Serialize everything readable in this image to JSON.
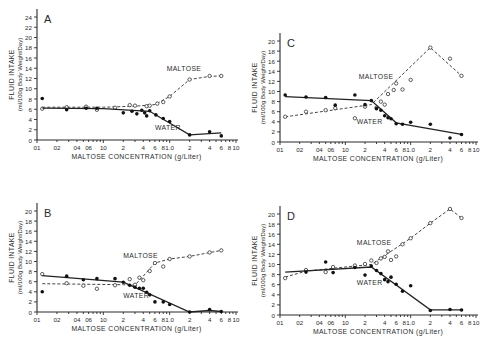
{
  "figure": {
    "xlabel": "MALTOSE CONCENTRATION (g/Liter)",
    "ylabel_line1": "FLUID INTAKE",
    "ylabel_line2": "(ml/100g Body Weight/Day)",
    "x_tick_labels": [
      {
        "v": 0.01,
        "t": "01"
      },
      {
        "v": 0.02,
        "t": "02"
      },
      {
        "v": 0.04,
        "t": "04"
      },
      {
        "v": 0.06,
        "t": "06"
      },
      {
        "v": 0.1,
        "t": "10"
      },
      {
        "v": 0.2,
        "t": "2"
      },
      {
        "v": 0.4,
        "t": "4"
      },
      {
        "v": 0.6,
        "t": "6"
      },
      {
        "v": 0.8,
        "t": "8"
      },
      {
        "v": 1,
        "t": "1.0"
      },
      {
        "v": 2,
        "t": "2"
      },
      {
        "v": 4,
        "t": "4"
      },
      {
        "v": 6,
        "t": "6"
      },
      {
        "v": 8,
        "t": "8"
      },
      {
        "v": 10,
        "t": "10"
      }
    ],
    "series_labels": {
      "maltose": "MALTOSE",
      "water": "WATER"
    }
  },
  "chart_data": [
    {
      "panel": "A",
      "type": "line",
      "title": "A",
      "xlabel": "MALTOSE CONCENTRATION (g/Liter)",
      "ylabel": "FLUID INTAKE (ml/100g Body Weight/Day)",
      "xscale": "log",
      "xlim": [
        0.01,
        10
      ],
      "ylim": [
        0,
        24
      ],
      "yticks": [
        0,
        2,
        4,
        6,
        8,
        10,
        12,
        14,
        16,
        18,
        20,
        22,
        24
      ],
      "grid": false,
      "frame": {
        "x0": 37,
        "x1": 236,
        "y0": 140,
        "ytop_val": 24,
        "ytop_px": 17
      },
      "label_pos": {
        "maltose": [
          0.9,
          13.5
        ],
        "water": [
          0.6,
          2.0
        ]
      },
      "series": [
        {
          "name": "MALTOSE",
          "style": "dashed-open-circle",
          "line": [
            [
              0.012,
              6.4
            ],
            [
              0.03,
              6.4
            ],
            [
              0.1,
              6.4
            ],
            [
              0.3,
              6.6
            ],
            [
              0.6,
              6.9
            ],
            [
              1,
              8.5
            ],
            [
              2,
              11.8
            ],
            [
              4,
              12.4
            ],
            [
              6,
              12.5
            ]
          ],
          "points": [
            [
              0.012,
              6.1
            ],
            [
              0.028,
              6.4
            ],
            [
              0.055,
              6.5
            ],
            [
              0.08,
              5.9
            ],
            [
              0.15,
              6.3
            ],
            [
              0.25,
              6.8
            ],
            [
              0.3,
              6.7
            ],
            [
              0.45,
              6.6
            ],
            [
              0.5,
              6.7
            ],
            [
              0.65,
              7.1
            ],
            [
              0.8,
              7.4
            ],
            [
              1,
              8.5
            ],
            [
              2,
              11.8
            ],
            [
              4,
              12.5
            ],
            [
              6,
              12.5
            ]
          ]
        },
        {
          "name": "WATER",
          "style": "solid-filled-circle",
          "line": [
            [
              0.012,
              6.2
            ],
            [
              0.1,
              6.1
            ],
            [
              0.5,
              5.6
            ],
            [
              2,
              1.0
            ],
            [
              6,
              1.4
            ]
          ],
          "points": [
            [
              0.012,
              8.1
            ],
            [
              0.028,
              5.9
            ],
            [
              0.055,
              6.2
            ],
            [
              0.08,
              6.2
            ],
            [
              0.2,
              5.3
            ],
            [
              0.27,
              5.6
            ],
            [
              0.32,
              5.1
            ],
            [
              0.38,
              5.8
            ],
            [
              0.42,
              5.3
            ],
            [
              0.45,
              4.7
            ],
            [
              0.5,
              5.7
            ],
            [
              0.62,
              4.9
            ],
            [
              0.8,
              4.2
            ],
            [
              1,
              3.6
            ],
            [
              2,
              1.0
            ],
            [
              4,
              1.6
            ],
            [
              6,
              0.8
            ]
          ]
        }
      ]
    },
    {
      "panel": "C",
      "type": "line",
      "title": "C",
      "xlabel": "MALTOSE CONCENTRATION (g/Liter)",
      "ylabel": "FLUID INTAKE (ml/100g Body Weight/Day)",
      "xscale": "log",
      "xlim": [
        0.01,
        10
      ],
      "ylim": [
        0,
        20
      ],
      "yticks": [
        0,
        2,
        4,
        6,
        8,
        10,
        12,
        14,
        16,
        18,
        20
      ],
      "grid": false,
      "frame": {
        "x0": 280,
        "x1": 476,
        "y0": 142,
        "ytop_val": 20,
        "ytop_px": 41
      },
      "label_pos": {
        "maltose": [
          0.16,
          12.5
        ],
        "water": [
          0.15,
          3.6
        ]
      },
      "series": [
        {
          "name": "MALTOSE",
          "style": "dashed-open-circle",
          "line": [
            [
              0.012,
              5.0
            ],
            [
              0.25,
              7.4
            ],
            [
              2,
              18.7
            ],
            [
              6,
              13.1
            ]
          ],
          "points": [
            [
              0.012,
              5.0
            ],
            [
              0.025,
              6.0
            ],
            [
              0.05,
              6.3
            ],
            [
              0.07,
              6.7
            ],
            [
              0.14,
              4.7
            ],
            [
              0.2,
              7.0
            ],
            [
              0.3,
              6.8
            ],
            [
              0.35,
              8.0
            ],
            [
              0.4,
              7.4
            ],
            [
              0.45,
              9.5
            ],
            [
              0.55,
              10.3
            ],
            [
              0.6,
              11.6
            ],
            [
              0.75,
              10.4
            ],
            [
              1,
              12.3
            ],
            [
              2,
              18.7
            ],
            [
              4,
              16.5
            ],
            [
              6,
              13.1
            ]
          ]
        },
        {
          "name": "WATER",
          "style": "solid-filled-circle",
          "line": [
            [
              0.012,
              9.0
            ],
            [
              0.25,
              8.2
            ],
            [
              0.6,
              3.8
            ],
            [
              6,
              1.5
            ]
          ],
          "points": [
            [
              0.012,
              9.3
            ],
            [
              0.025,
              8.9
            ],
            [
              0.05,
              8.8
            ],
            [
              0.07,
              7.3
            ],
            [
              0.14,
              9.3
            ],
            [
              0.2,
              7.4
            ],
            [
              0.25,
              8.2
            ],
            [
              0.3,
              6.6
            ],
            [
              0.35,
              6.3
            ],
            [
              0.4,
              5.2
            ],
            [
              0.45,
              4.8
            ],
            [
              0.5,
              4.6
            ],
            [
              0.6,
              3.6
            ],
            [
              0.75,
              3.5
            ],
            [
              1,
              3.9
            ],
            [
              2,
              3.5
            ],
            [
              4,
              0.8
            ],
            [
              6,
              1.5
            ]
          ]
        }
      ]
    },
    {
      "panel": "B",
      "type": "line",
      "title": "B",
      "xlabel": "MALTOSE CONCENTRATION (g/Liter)",
      "ylabel": "FLUID INTAKE (ml/100g Body Weight/Day)",
      "xscale": "log",
      "xlim": [
        0.01,
        10
      ],
      "ylim": [
        0,
        20
      ],
      "yticks": [
        0,
        2,
        4,
        6,
        8,
        10,
        12,
        14,
        16,
        18,
        20
      ],
      "grid": false,
      "frame": {
        "x0": 37,
        "x1": 236,
        "y0": 312,
        "ytop_val": 20,
        "ytop_px": 211
      },
      "label_pos": {
        "maltose": [
          0.2,
          10.7
        ],
        "water": [
          0.2,
          2.8
        ]
      },
      "series": [
        {
          "name": "MALTOSE",
          "style": "dashed-open-circle",
          "line": [
            [
              0.012,
              5.6
            ],
            [
              0.2,
              5.4
            ],
            [
              0.3,
              5.3
            ],
            [
              0.6,
              9.7
            ],
            [
              1,
              10.5
            ],
            [
              2,
              11.0
            ],
            [
              6,
              12.2
            ]
          ],
          "points": [
            [
              0.012,
              7.5
            ],
            [
              0.028,
              5.7
            ],
            [
              0.05,
              5.2
            ],
            [
              0.08,
              4.6
            ],
            [
              0.15,
              5.3
            ],
            [
              0.25,
              6.5
            ],
            [
              0.3,
              5.4
            ],
            [
              0.35,
              6.8
            ],
            [
              0.4,
              6.3
            ],
            [
              0.5,
              8.1
            ],
            [
              0.6,
              9.7
            ],
            [
              0.8,
              9.0
            ],
            [
              1,
              10.5
            ],
            [
              2,
              11.0
            ],
            [
              4,
              11.8
            ],
            [
              6,
              12.2
            ]
          ]
        },
        {
          "name": "WATER",
          "style": "solid-filled-circle",
          "line": [
            [
              0.012,
              7.2
            ],
            [
              0.2,
              5.9
            ],
            [
              2,
              0.0
            ],
            [
              4,
              0.3
            ],
            [
              6,
              0.1
            ]
          ],
          "points": [
            [
              0.012,
              4.0
            ],
            [
              0.028,
              7.1
            ],
            [
              0.05,
              6.4
            ],
            [
              0.08,
              6.6
            ],
            [
              0.15,
              6.6
            ],
            [
              0.2,
              5.9
            ],
            [
              0.25,
              5.3
            ],
            [
              0.3,
              4.9
            ],
            [
              0.35,
              4.7
            ],
            [
              0.4,
              4.7
            ],
            [
              0.45,
              3.9
            ],
            [
              0.5,
              3.4
            ],
            [
              0.6,
              2.0
            ],
            [
              0.8,
              2.0
            ],
            [
              1,
              1.5
            ],
            [
              2,
              0.0
            ],
            [
              4,
              0.5
            ],
            [
              6,
              0.1
            ]
          ]
        }
      ]
    },
    {
      "panel": "D",
      "type": "line",
      "title": "D",
      "xlabel": "MALTOSE CONCENTRATION (g/Liter)",
      "ylabel": "FLUID INTAKE (ml/100g Body Weight/Day)",
      "xscale": "log",
      "xlim": [
        0.01,
        10
      ],
      "ylim": [
        0,
        20
      ],
      "yticks": [
        0,
        2,
        4,
        6,
        8,
        10,
        12,
        14,
        16,
        18,
        20
      ],
      "grid": false,
      "frame": {
        "x0": 280,
        "x1": 476,
        "y0": 315,
        "ytop_val": 20,
        "ytop_px": 214
      },
      "label_pos": {
        "maltose": [
          0.15,
          13.8
        ],
        "water": [
          0.15,
          5.9
        ]
      },
      "series": [
        {
          "name": "MALTOSE",
          "style": "dashed-open-circle",
          "line": [
            [
              0.012,
              7.5
            ],
            [
              0.025,
              8.7
            ],
            [
              0.1,
              9.5
            ],
            [
              0.25,
              10.0
            ],
            [
              1,
              15.2
            ],
            [
              2,
              18.2
            ],
            [
              4,
              21.0
            ],
            [
              6,
              19.2
            ]
          ],
          "points": [
            [
              0.012,
              7.3
            ],
            [
              0.025,
              8.9
            ],
            [
              0.05,
              8.5
            ],
            [
              0.065,
              9.5
            ],
            [
              0.14,
              9.8
            ],
            [
              0.2,
              10.1
            ],
            [
              0.25,
              10.8
            ],
            [
              0.3,
              10.3
            ],
            [
              0.35,
              11.2
            ],
            [
              0.4,
              11.5
            ],
            [
              0.45,
              12.6
            ],
            [
              0.5,
              10.9
            ],
            [
              0.6,
              11.6
            ],
            [
              0.75,
              14.0
            ],
            [
              1,
              15.2
            ],
            [
              2,
              18.2
            ],
            [
              4,
              21.0
            ],
            [
              6,
              19.2
            ]
          ]
        },
        {
          "name": "WATER",
          "style": "solid-filled-circle",
          "line": [
            [
              0.012,
              8.5
            ],
            [
              0.25,
              9.5
            ],
            [
              2,
              1.0
            ],
            [
              6,
              1.0
            ]
          ],
          "points": [
            [
              0.025,
              8.5
            ],
            [
              0.05,
              10.5
            ],
            [
              0.065,
              8.4
            ],
            [
              0.14,
              9.4
            ],
            [
              0.2,
              7.9
            ],
            [
              0.25,
              9.7
            ],
            [
              0.3,
              8.8
            ],
            [
              0.35,
              8.2
            ],
            [
              0.4,
              7.0
            ],
            [
              0.45,
              6.6
            ],
            [
              0.5,
              7.5
            ],
            [
              0.6,
              6.1
            ],
            [
              0.75,
              4.7
            ],
            [
              1,
              5.8
            ],
            [
              2,
              0.9
            ],
            [
              4,
              1.1
            ],
            [
              6,
              1.0
            ]
          ]
        }
      ]
    }
  ]
}
